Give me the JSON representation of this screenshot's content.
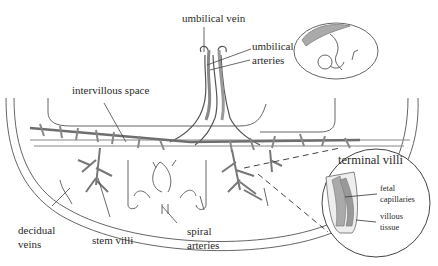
{
  "diagram": {
    "labels": {
      "umbilical_vein": "umbilical vein",
      "umbilical_arteries_1": "umbilical",
      "umbilical_arteries_2": "arteries",
      "intervillous_space": "intervillous space",
      "decidual_veins_1": "decidual",
      "decidual_veins_2": "veins",
      "stem_villi": "stem villi",
      "spiral_arteries_1": "spiral",
      "spiral_arteries_2": "arteries",
      "terminal_villi": "terminal villi",
      "fetal_capillaries_1": "fetal",
      "fetal_capillaries_2": "capillaries",
      "villous_tissue_1": "villous",
      "villous_tissue_2": "tissue"
    },
    "inset_top_right": "fetus-in-uterus-icon",
    "inset_callout": "terminal-villi-magnified-circle",
    "colors": {
      "line": "#555555",
      "vessel_fill": "#9a9a9a",
      "vessel_dark": "#6e6e6e",
      "text": "#2a2a2a"
    }
  }
}
